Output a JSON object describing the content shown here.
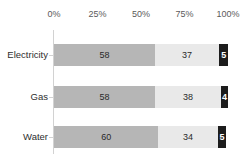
{
  "chart_data": {
    "type": "bar",
    "subtype": "stacked-bar-horizontal-100pct",
    "title": "",
    "xlabel": "",
    "ylabel": "",
    "orientation": "horizontal",
    "stacked": true,
    "grid": false,
    "legend": false,
    "legend_position": "none",
    "axis_position": "top",
    "xlim": [
      0,
      100
    ],
    "xticks": [
      0,
      25,
      50,
      75,
      100
    ],
    "xtick_labels": [
      "0%",
      "25%",
      "50%",
      "75%",
      "100%"
    ],
    "categories": [
      "Electricity",
      "Gas",
      "Water"
    ],
    "series": [
      {
        "name": "segment-1",
        "color": "#b6b6b6",
        "values": [
          58,
          58,
          60
        ]
      },
      {
        "name": "segment-2",
        "color": "#e9e9e9",
        "values": [
          37,
          38,
          34
        ]
      },
      {
        "name": "segment-3",
        "color": "#1c1c1c",
        "values": [
          5,
          4,
          5
        ]
      }
    ],
    "rows": [
      {
        "label": "Electricity",
        "segments": [
          {
            "value": 58,
            "label": "58",
            "color": "#b6b6b6"
          },
          {
            "value": 37,
            "label": "37",
            "color": "#e9e9e9"
          },
          {
            "value": 5,
            "label": "5",
            "color": "#1c1c1c"
          }
        ]
      },
      {
        "label": "Gas",
        "segments": [
          {
            "value": 58,
            "label": "58",
            "color": "#b6b6b6"
          },
          {
            "value": 38,
            "label": "38",
            "color": "#e9e9e9"
          },
          {
            "value": 4,
            "label": "4",
            "color": "#1c1c1c"
          }
        ]
      },
      {
        "label": "Water",
        "segments": [
          {
            "value": 60,
            "label": "60",
            "color": "#b6b6b6"
          },
          {
            "value": 34,
            "label": "34",
            "color": "#e9e9e9"
          },
          {
            "value": 5,
            "label": "5",
            "color": "#1c1c1c"
          }
        ]
      }
    ]
  },
  "axis": {
    "ticks": [
      {
        "label": "0%",
        "value": 0
      },
      {
        "label": "25%",
        "value": 25
      },
      {
        "label": "50%",
        "value": 50
      },
      {
        "label": "75%",
        "value": 75
      },
      {
        "label": "100%",
        "value": 100
      }
    ]
  },
  "layout": {
    "plot_left": 54,
    "plot_width": 174,
    "row_height": 22,
    "row_tops": [
      44,
      86,
      126
    ]
  },
  "colors": {
    "segment_1": "#b6b6b6",
    "segment_2": "#e9e9e9",
    "segment_3": "#1c1c1c",
    "axis_line": "#d2d2d2",
    "tick_text": "#5a5a5a",
    "category_text": "#2e2e2e",
    "background": "#ffffff"
  }
}
